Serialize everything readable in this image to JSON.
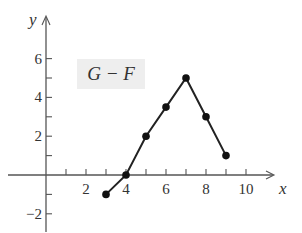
{
  "chart_data": {
    "type": "line",
    "title": "",
    "legend": [
      "G − F"
    ],
    "xlabel": "x",
    "ylabel": "y",
    "xlim": [
      -1.2,
      12
    ],
    "ylim": [
      -2.8,
      7.5
    ],
    "x_ticks": [
      2,
      4,
      6,
      8,
      10
    ],
    "x_minor_ticks": [
      1,
      2,
      3,
      4,
      5,
      6,
      7,
      8,
      9,
      10
    ],
    "y_ticks": [
      -2,
      2,
      4,
      6
    ],
    "y_minor_ticks": [
      -2,
      -1,
      1,
      2,
      3,
      4,
      5,
      6
    ],
    "grid": false,
    "series": [
      {
        "name": "G − F",
        "x": [
          3,
          4,
          5,
          6,
          7,
          8,
          9
        ],
        "values": [
          -1,
          0,
          2,
          3.5,
          5,
          3,
          1
        ],
        "markers": true
      }
    ]
  },
  "labels": {
    "legend": "G − F",
    "x_axis": "x",
    "y_axis": "y",
    "x_ticks": [
      "2",
      "4",
      "6",
      "8",
      "10"
    ],
    "y_ticks": [
      "6",
      "4",
      "2",
      "−2"
    ]
  }
}
